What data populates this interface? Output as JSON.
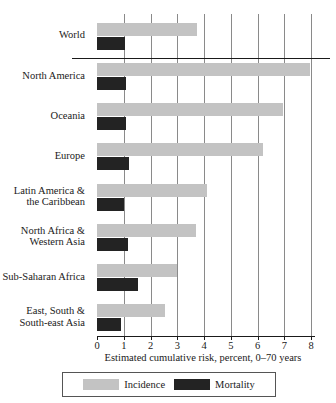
{
  "chart_data": {
    "type": "bar",
    "orientation": "horizontal",
    "title": "",
    "xlabel": "Estimated cumulative risk, percent, 0–70 years",
    "ylabel": "",
    "xlim": [
      0,
      8
    ],
    "xticks": [
      0,
      1,
      2,
      3,
      4,
      5,
      6,
      7,
      8
    ],
    "xtick_labels": [
      "0",
      "1",
      "2",
      "3",
      "4",
      "5",
      "6",
      "7",
      "8"
    ],
    "grid": true,
    "grid_axis": "x",
    "legend_position": "bottom",
    "categories": [
      "World",
      "North America",
      "Oceania",
      "Europe",
      "Latin America & the Caribbean",
      "North Africa & Western Asia",
      "Sub-Saharan Africa",
      "East, South & South-east Asia"
    ],
    "category_label_lines": [
      [
        "World"
      ],
      [
        "North America"
      ],
      [
        "Oceania"
      ],
      [
        "Europe"
      ],
      [
        "Latin America &",
        "the Caribbean"
      ],
      [
        "North Africa &",
        "Western Asia"
      ],
      [
        "Sub-Saharan Africa"
      ],
      [
        "East, South &",
        "South-east Asia"
      ]
    ],
    "series": [
      {
        "name": "Incidence",
        "color": "#c3c3c3",
        "values": [
          3.75,
          7.95,
          6.95,
          6.2,
          4.1,
          3.7,
          3.0,
          2.55
        ]
      },
      {
        "name": "Mortality",
        "color": "#232323",
        "values": [
          1.05,
          1.1,
          1.1,
          1.2,
          1.0,
          1.15,
          1.55,
          0.9
        ]
      }
    ],
    "separator_after_category_index": 0
  },
  "legend": {
    "items": [
      {
        "label": "Incidence",
        "swatch": "incidence-swatch"
      },
      {
        "label": "Mortality",
        "swatch": "mortality-swatch"
      }
    ]
  },
  "axis": {
    "x_title": "Estimated cumulative risk, percent, 0–70 years"
  }
}
